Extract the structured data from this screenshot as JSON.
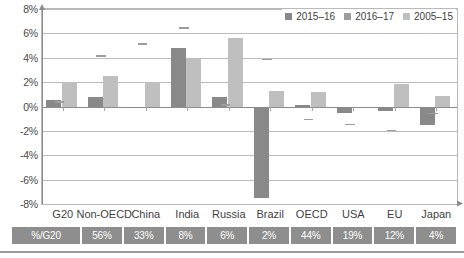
{
  "legend": {
    "position": "top-right",
    "items": [
      {
        "label": "2015–16",
        "color": "#898989"
      },
      {
        "label": "2016–17",
        "color": "#9d9d9d"
      },
      {
        "label": "2005–15",
        "color": "#bfbfbf"
      }
    ]
  },
  "table": {
    "header": "%/G20",
    "values": [
      "56%",
      "33%",
      "8%",
      "6%",
      "2%",
      "44%",
      "19%",
      "12%",
      "4%"
    ]
  },
  "chart_data": {
    "type": "bar",
    "title": "",
    "subtitle": "",
    "xlabel": "",
    "ylabel": "",
    "ylim": [
      -8,
      8
    ],
    "grid": true,
    "legend_position": "top-right",
    "categories": [
      "G20",
      "Non-OECD",
      "China",
      "India",
      "Russia",
      "Brazil",
      "OECD",
      "USA",
      "EU",
      "Japan"
    ],
    "tick_labels": [
      "8%",
      "6%",
      "4%",
      "2%",
      "0%",
      "-2%",
      "-4%",
      "-6%",
      "-8%"
    ],
    "tick_values": [
      8,
      6,
      4,
      2,
      0,
      -2,
      -4,
      -6,
      -8
    ],
    "series": [
      {
        "name": "2015–16",
        "style": "bar",
        "color": "#898989",
        "values": [
          0.5,
          0.75,
          -0.1,
          4.8,
          0.8,
          -7.5,
          0.1,
          -0.55,
          -0.4,
          -1.5
        ]
      },
      {
        "name": "2016–17",
        "style": "marker",
        "color": "#9d9d9d",
        "values": [
          0.45,
          4.2,
          5.2,
          6.5,
          0.2,
          3.9,
          -1.0,
          -1.4,
          -1.9,
          -0.5
        ]
      },
      {
        "name": "2005–15",
        "style": "bar",
        "color": "#bfbfbf",
        "values": [
          2.0,
          2.5,
          2.0,
          3.9,
          5.65,
          1.25,
          1.2,
          null,
          1.85,
          0.9
        ]
      }
    ],
    "annotation_row": {
      "label": "%/G20",
      "values": [
        null,
        "56%",
        "33%",
        "8%",
        "6%",
        "2%",
        "44%",
        "19%",
        "12%",
        "4%"
      ]
    }
  }
}
